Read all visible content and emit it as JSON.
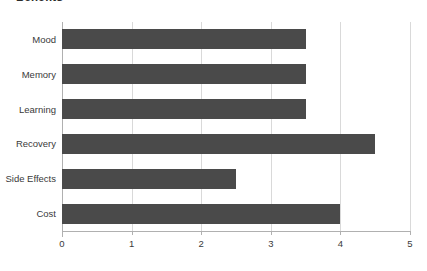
{
  "chart_data": {
    "type": "bar",
    "orientation": "horizontal",
    "title": "Benefits",
    "xlabel": "",
    "ylabel": "",
    "categories": [
      "Mood",
      "Memory",
      "Learning",
      "Recovery",
      "Side Effects",
      "Cost"
    ],
    "values": [
      3.5,
      3.5,
      3.5,
      4.5,
      2.5,
      4.0
    ],
    "xlim": [
      0,
      5
    ],
    "xticks": [
      0,
      1,
      2,
      3,
      4,
      5
    ],
    "xtick_labels": [
      "0",
      "1",
      "2",
      "3",
      "4",
      "5"
    ],
    "grid": "vertical",
    "legend": null,
    "bar_color": "#4a4a4a",
    "gridline_color": "#d9d9d9",
    "axis_color": "#b0b0b0",
    "background": "#ffffff"
  }
}
